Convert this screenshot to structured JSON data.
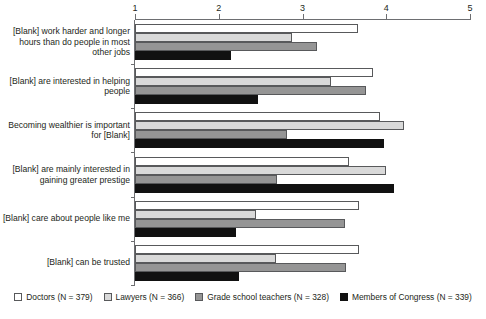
{
  "chart_data": {
    "type": "bar",
    "orientation": "horizontal",
    "title": "",
    "xlabel": "",
    "ylabel": "",
    "xlim": [
      1,
      5
    ],
    "xticks": [
      1,
      2,
      3,
      4,
      5
    ],
    "xtick_labels": [
      "1",
      "2",
      "3",
      "4",
      "5"
    ],
    "grid": false,
    "legend_position": "bottom",
    "categories": [
      "[Blank] work harder and longer hours than do people in most other jobs",
      "[Blank] are interested in helping people",
      "Becoming wealthier is important for [Blank]",
      "[Blank] are mainly interested in gaining greater prestige",
      "[Blank] care about people like me",
      "[Blank] can be trusted"
    ],
    "series": [
      {
        "name": "Doctors (N = 379)",
        "color": "#ffffff",
        "values": [
          3.66,
          3.84,
          3.93,
          3.55,
          3.67,
          3.68
        ]
      },
      {
        "name": "Lawyers (N = 366)",
        "color": "#d9d9d9",
        "values": [
          2.87,
          3.34,
          4.21,
          4.0,
          2.44,
          2.68
        ]
      },
      {
        "name": "Grade school teachers (N = 328)",
        "color": "#959595",
        "values": [
          3.17,
          3.76,
          2.81,
          2.69,
          3.51,
          3.52
        ]
      },
      {
        "name": "Members of Congress (N = 339)",
        "color": "#111111",
        "values": [
          2.15,
          2.47,
          3.97,
          4.09,
          2.2,
          2.24
        ]
      }
    ]
  }
}
